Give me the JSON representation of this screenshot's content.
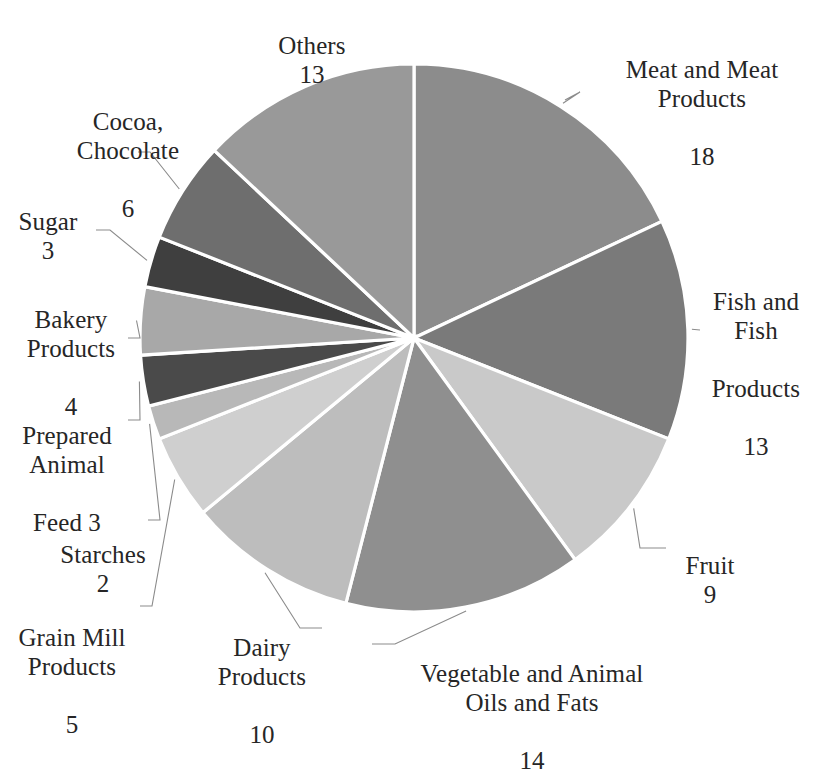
{
  "chart_data": {
    "type": "pie",
    "title": "",
    "subtitle": "",
    "xlabel": "",
    "ylabel": "",
    "legend_position": "none",
    "grid": false,
    "labels_show_value": true,
    "start_angle_deg": 0,
    "direction": "clockwise",
    "total": 100,
    "categories": [
      "Meat and Meat Products",
      "Fish and Fish Products",
      "Fruit",
      "Vegetable and Animal Oils and Fats",
      "Dairy Products",
      "Grain Mill Products",
      "Starches",
      "Prepared Animal Feed",
      "Bakery Products",
      "Sugar",
      "Cocoa, Chocolate",
      "Others"
    ],
    "values": [
      18,
      13,
      9,
      14,
      10,
      5,
      2,
      3,
      4,
      3,
      6,
      13
    ],
    "colors": [
      "#8c8c8c",
      "#7a7a7a",
      "#c9c9c9",
      "#8f8f8f",
      "#bdbdbd",
      "#cfcfcf",
      "#b8b8b8",
      "#4a4a4a",
      "#a8a8a8",
      "#3f3f3f",
      "#6e6e6e",
      "#999999"
    ],
    "slices": [
      {
        "label": "Meat and Meat Products",
        "value": 18,
        "color": "#8c8c8c"
      },
      {
        "label": "Fish and Fish Products",
        "value": 13,
        "color": "#7a7a7a"
      },
      {
        "label": "Fruit",
        "value": 9,
        "color": "#c9c9c9"
      },
      {
        "label": "Vegetable and Animal Oils and Fats",
        "value": 14,
        "color": "#8f8f8f"
      },
      {
        "label": "Dairy Products",
        "value": 10,
        "color": "#bdbdbd"
      },
      {
        "label": "Grain Mill Products",
        "value": 5,
        "color": "#cfcfcf"
      },
      {
        "label": "Starches",
        "value": 2,
        "color": "#b8b8b8"
      },
      {
        "label": "Prepared Animal Feed",
        "value": 3,
        "color": "#4a4a4a"
      },
      {
        "label": "Bakery Products",
        "value": 4,
        "color": "#a8a8a8"
      },
      {
        "label": "Sugar",
        "value": 3,
        "color": "#3f3f3f"
      },
      {
        "label": "Cocoa, Chocolate",
        "value": 6,
        "color": "#6e6e6e"
      },
      {
        "label": "Others",
        "value": 13,
        "color": "#999999"
      }
    ]
  },
  "labels": {
    "others": {
      "name": "Others",
      "value": "13"
    },
    "meat": {
      "line1": "Meat and Meat",
      "line2": "Products",
      "value": "18"
    },
    "fish": {
      "line1": "Fish and",
      "line2": "Fish",
      "line3": "Products",
      "value": "13"
    },
    "fruit": {
      "name": "Fruit",
      "value": "9"
    },
    "vegetable_oils": {
      "line1": "Vegetable and Animal",
      "line2": "Oils and Fats",
      "value": "14"
    },
    "dairy": {
      "line1": "Dairy",
      "line2": "Products",
      "value": "10"
    },
    "grain_mill": {
      "line1": "Grain Mill",
      "line2": "Products",
      "value": "5"
    },
    "starches": {
      "name": "Starches",
      "value": "2"
    },
    "prepared_animal_feed": {
      "line1": "Prepared",
      "line2": "Animal",
      "line3": "Feed 3"
    },
    "bakery": {
      "line1": "Bakery",
      "line2": "Products",
      "value": "4"
    },
    "sugar": {
      "name": "Sugar",
      "value": "3"
    },
    "cocoa": {
      "line1": "Cocoa,",
      "line2": "Chocolate",
      "value": "6"
    }
  },
  "style": {
    "background": "#ffffff",
    "text_color": "#262626",
    "leader_color": "#8b8b8b",
    "slice_border": "#ffffff"
  }
}
